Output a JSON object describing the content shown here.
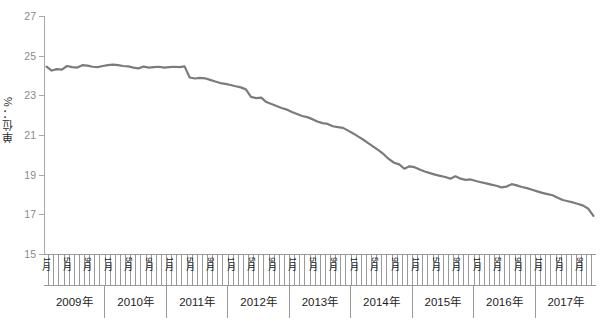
{
  "chart_data": {
    "type": "line",
    "title": "",
    "subtitle": "",
    "xlabel": "",
    "ylabel": "单位：%",
    "ylim": [
      15,
      27
    ],
    "y_ticks": [
      15,
      17,
      19,
      21,
      23,
      25,
      27
    ],
    "grid": false,
    "legend": null,
    "line_color": "#7b7b7b",
    "x_group_label_suffix": "年",
    "month_label_suffix": "月",
    "labeled_months": [
      1,
      5,
      9
    ],
    "months_per_year": 12,
    "years": [
      "2009年",
      "2010年",
      "2011年",
      "2012年",
      "2013年",
      "2014年",
      "2015年",
      "2016年",
      "2017年"
    ],
    "month_tick_labels": [
      "1月",
      "",
      "",
      "",
      "5月",
      "",
      "",
      "",
      "9月",
      "",
      "",
      "",
      "1月",
      "",
      "",
      "",
      "5月",
      "",
      "",
      "",
      "9月",
      "",
      "",
      "",
      "1月",
      "",
      "",
      "",
      "5月",
      "",
      "",
      "",
      "9月",
      "",
      "",
      "",
      "1月",
      "",
      "",
      "",
      "5月",
      "",
      "",
      "",
      "9月",
      "",
      "",
      "",
      "1月",
      "",
      "",
      "",
      "5月",
      "",
      "",
      "",
      "9月",
      "",
      "",
      "",
      "1月",
      "",
      "",
      "",
      "5月",
      "",
      "",
      "",
      "9月",
      "",
      "",
      "",
      "1月",
      "",
      "",
      "",
      "5月",
      "",
      "",
      "",
      "9月",
      "",
      "",
      "",
      "1月",
      "",
      "",
      "",
      "5月",
      "",
      "",
      "",
      "9月",
      "",
      "",
      "",
      "1月",
      "",
      "",
      "",
      "5月",
      "",
      "",
      "",
      "9月",
      "",
      "",
      ""
    ],
    "x": [
      "2009年1月",
      "2009年2月",
      "2009年3月",
      "2009年4月",
      "2009年5月",
      "2009年6月",
      "2009年7月",
      "2009年8月",
      "2009年9月",
      "2009年10月",
      "2009年11月",
      "2009年12月",
      "2010年1月",
      "2010年2月",
      "2010年3月",
      "2010年4月",
      "2010年5月",
      "2010年6月",
      "2010年7月",
      "2010年8月",
      "2010年9月",
      "2010年10月",
      "2010年11月",
      "2010年12月",
      "2011年1月",
      "2011年2月",
      "2011年3月",
      "2011年4月",
      "2011年5月",
      "2011年6月",
      "2011年7月",
      "2011年8月",
      "2011年9月",
      "2011年10月",
      "2011年11月",
      "2011年12月",
      "2012年1月",
      "2012年2月",
      "2012年3月",
      "2012年4月",
      "2012年5月",
      "2012年6月",
      "2012年7月",
      "2012年8月",
      "2012年9月",
      "2012年10月",
      "2012年11月",
      "2012年12月",
      "2013年1月",
      "2013年2月",
      "2013年3月",
      "2013年4月",
      "2013年5月",
      "2013年6月",
      "2013年7月",
      "2013年8月",
      "2013年9月",
      "2013年10月",
      "2013年11月",
      "2013年12月",
      "2014年1月",
      "2014年2月",
      "2014年3月",
      "2014年4月",
      "2014年5月",
      "2014年6月",
      "2014年7月",
      "2014年8月",
      "2014年9月",
      "2014年10月",
      "2014年11月",
      "2014年12月",
      "2015年1月",
      "2015年2月",
      "2015年3月",
      "2015年4月",
      "2015年5月",
      "2015年6月",
      "2015年7月",
      "2015年8月",
      "2015年9月",
      "2015年10月",
      "2015年11月",
      "2015年12月",
      "2016年1月",
      "2016年2月",
      "2016年3月",
      "2016年4月",
      "2016年5月",
      "2016年6月",
      "2016年7月",
      "2016年8月",
      "2016年9月",
      "2016年10月",
      "2016年11月",
      "2016年12月",
      "2017年1月",
      "2017年2月",
      "2017年3月",
      "2017年4月",
      "2017年5月",
      "2017年6月",
      "2017年7月",
      "2017年8月",
      "2017年9月",
      "2017年10月",
      "2017年11月",
      "2017年12月"
    ],
    "values": [
      24.45,
      24.25,
      24.32,
      24.3,
      24.48,
      24.42,
      24.4,
      24.52,
      24.5,
      24.44,
      24.42,
      24.48,
      24.52,
      24.55,
      24.52,
      24.48,
      24.46,
      24.4,
      24.36,
      24.45,
      24.4,
      24.42,
      24.44,
      24.4,
      24.42,
      24.44,
      24.42,
      24.46,
      23.9,
      23.85,
      23.88,
      23.86,
      23.78,
      23.7,
      23.62,
      23.58,
      23.52,
      23.46,
      23.4,
      23.3,
      22.92,
      22.86,
      22.88,
      22.66,
      22.56,
      22.46,
      22.36,
      22.28,
      22.16,
      22.06,
      21.96,
      21.9,
      21.8,
      21.68,
      21.6,
      21.56,
      21.44,
      21.4,
      21.36,
      21.22,
      21.08,
      20.92,
      20.76,
      20.58,
      20.4,
      20.22,
      20.02,
      19.78,
      19.6,
      19.52,
      19.3,
      19.42,
      19.38,
      19.26,
      19.16,
      19.08,
      19.0,
      18.94,
      18.88,
      18.8,
      18.92,
      18.8,
      18.74,
      18.76,
      18.68,
      18.62,
      18.56,
      18.5,
      18.44,
      18.36,
      18.4,
      18.52,
      18.46,
      18.38,
      18.32,
      18.24,
      18.16,
      18.08,
      18.02,
      17.96,
      17.84,
      17.72,
      17.66,
      17.6,
      17.52,
      17.44,
      17.28,
      16.92
    ]
  }
}
